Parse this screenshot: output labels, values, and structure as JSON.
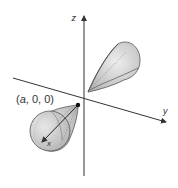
{
  "diagram": {
    "type": "3d-axes-with-surfaces",
    "axes": {
      "x_label": "x",
      "y_label": "y",
      "z_label": "z"
    },
    "point_label": {
      "prefix": "(",
      "var": "a",
      "rest": ", 0, 0)"
    },
    "colors": {
      "axis": "#333333",
      "surface_fill": "#c8c8c8",
      "surface_light": "#e6e6e6",
      "surface_edge": "#555555",
      "hidden_line": "#888888",
      "point": "#111111"
    },
    "shapes": [
      {
        "name": "upper-lobe",
        "description": "teardrop surface opening up and right from origin"
      },
      {
        "name": "lower-lobe",
        "description": "teardrop surface opening toward +x from point (a,0,0)"
      }
    ]
  }
}
